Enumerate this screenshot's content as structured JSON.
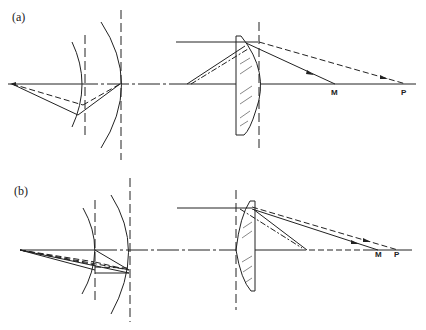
{
  "panels": [
    {
      "label": "(a)",
      "description": "Mirror system (left) and plano-convex lens (right); convex surface facing image side",
      "points": {
        "M": "M",
        "P": "P"
      }
    },
    {
      "label": "(b)",
      "description": "Mirror system (left) with multiple rays and plano-convex lens (right); convex surface facing object side",
      "points": {
        "M": "M",
        "P": "P"
      }
    }
  ],
  "colors": {
    "ink": "#222222",
    "background": "#ffffff"
  }
}
